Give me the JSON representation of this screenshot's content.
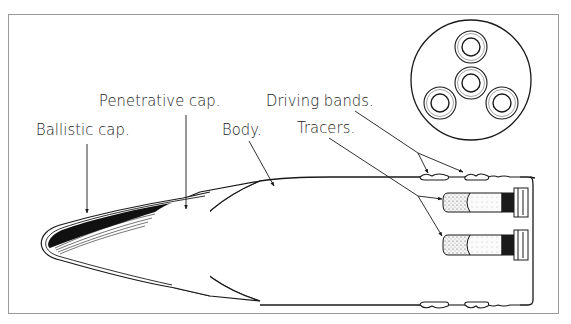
{
  "figure": {
    "labels": {
      "penetrative_cap": "Penetrative cap.",
      "ballistic_cap": "Ballistic cap.",
      "body": "Body.",
      "driving_bands": "Driving bands.",
      "tracers": "Tracers."
    },
    "base_view": {
      "shape": "circle",
      "tracer_openings": 4
    },
    "colors": {
      "ink": "#1a1a1a",
      "frame": "#9a9a9a",
      "background": "#ffffff"
    }
  }
}
